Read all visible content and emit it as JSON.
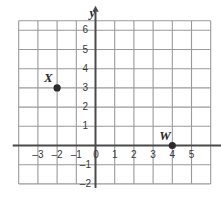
{
  "chart_data": {
    "type": "scatter",
    "title": "",
    "xlabel": "x",
    "ylabel": "y",
    "grid": true,
    "legend": null,
    "xlim": [
      -4,
      6
    ],
    "ylim": [
      -2,
      6.5
    ],
    "xticks": [
      -3,
      -2,
      -1,
      0,
      1,
      2,
      3,
      4,
      5
    ],
    "yticks": [
      -2,
      -1,
      1,
      2,
      3,
      4,
      5,
      6
    ],
    "xtick_labels": [
      "–3",
      "–2",
      "–1",
      "0",
      "1",
      "2",
      "3",
      "4",
      "5"
    ],
    "ytick_labels": [
      "–2",
      "–1",
      "1",
      "2",
      "3",
      "4",
      "5",
      "6"
    ],
    "origin_label": "0",
    "points": [
      {
        "label": "X",
        "x": -2,
        "y": 3
      },
      {
        "label": "W",
        "x": 4,
        "y": 0
      }
    ],
    "colors": {
      "grid_line": "#9a9a9a",
      "axis_line": "#4a4a4a",
      "point_fill": "#2b2b2b",
      "text": "#3a3a3a",
      "background": "#ffffff"
    }
  }
}
